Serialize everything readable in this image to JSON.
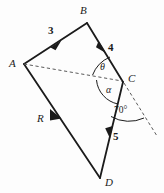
{
  "figure": {
    "stroke_color": "#1b1b1b",
    "dash_color": "#5a5a5a",
    "background": "#fdfdfd"
  },
  "points": [
    {
      "name": "A",
      "label": "A",
      "x": 24,
      "y": 64,
      "label_x": 9,
      "label_y": 58
    },
    {
      "name": "B",
      "label": "B",
      "x": 87,
      "y": 23,
      "label_x": 80,
      "label_y": 6
    },
    {
      "name": "C",
      "label": "C",
      "x": 123,
      "y": 82,
      "label_x": 128,
      "label_y": 72
    },
    {
      "name": "D",
      "label": "D",
      "x": 100,
      "y": 178,
      "label_x": 105,
      "label_y": 178
    }
  ],
  "vectors": [
    {
      "name": "vector-ab",
      "from": "A",
      "to": "B",
      "magnitude": "3",
      "label_x": 48,
      "label_y": 25
    },
    {
      "name": "vector-bc",
      "from": "B",
      "to": "C",
      "magnitude": "4",
      "label_x": 108,
      "label_y": 42
    },
    {
      "name": "vector-cd",
      "from": "C",
      "to": "D",
      "magnitude": "5",
      "label_x": 113,
      "label_y": 132
    },
    {
      "name": "vector-ad",
      "from": "A",
      "to": "D",
      "magnitude": "R",
      "label_x": 38,
      "label_y": 113
    }
  ],
  "angles": [
    {
      "name": "angle-theta",
      "label": "θ",
      "label_x": 100,
      "label_y": 63
    },
    {
      "name": "angle-alpha",
      "label": "α",
      "label_x": 106,
      "label_y": 85
    },
    {
      "name": "angle-seventy",
      "label": "70°",
      "label_x": 114,
      "label_y": 107
    }
  ],
  "construction_lines": [
    {
      "name": "dashed-diagonal-ac",
      "style": "dashed",
      "from": "A",
      "to": "C"
    },
    {
      "name": "dashed-extension-beyond-c",
      "style": "dashed",
      "from": "C",
      "to": "extension"
    }
  ]
}
